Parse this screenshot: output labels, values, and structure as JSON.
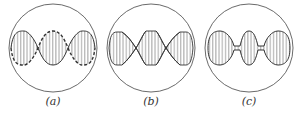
{
  "figure": {
    "panels": [
      {
        "id": "a",
        "label": "(a)",
        "center_x": 53,
        "description": "three lobes, dashed envelope on alternate edges"
      },
      {
        "id": "b",
        "label": "(b)",
        "center_x": 151,
        "description": "lobes with flattened crests, crossing envelopes"
      },
      {
        "id": "c",
        "label": "(c)",
        "center_x": 249,
        "description": "three separated ellipsoidal lobes joined by thin necks"
      }
    ],
    "stroke_color": "#333333",
    "background": "#ffffff"
  }
}
